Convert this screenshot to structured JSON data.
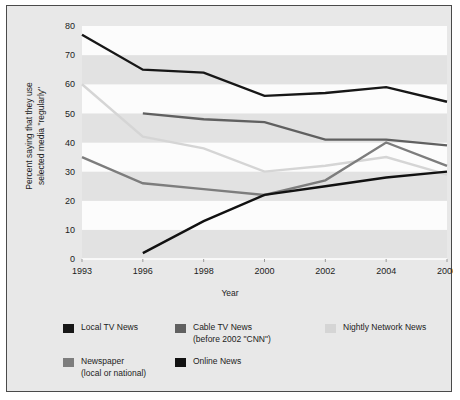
{
  "chart_data": {
    "type": "line",
    "title": "",
    "xlabel": "Year",
    "ylabel": "Percent saying that they use\nselected media \"regularly\"",
    "categories": [
      "1993",
      "1996",
      "1998",
      "2000",
      "2002",
      "2004",
      "2006"
    ],
    "x_tick_labels": [
      "1993",
      "1996",
      "1998",
      "2000",
      "2002",
      "2004",
      "2006"
    ],
    "y_tick_labels": [
      "0",
      "10",
      "20",
      "30",
      "40",
      "50",
      "60",
      "70",
      "80"
    ],
    "ylim": [
      0,
      80
    ],
    "y_tick_step": 10,
    "grid": "horizontal-banding",
    "legend_position": "bottom",
    "series": [
      {
        "name": "Local TV News",
        "color": "#171717",
        "values": [
          77,
          65,
          64,
          56,
          57,
          59,
          54
        ]
      },
      {
        "name": "Cable TV News\n(before 2002 \"CNN\")",
        "color": "#606060",
        "values": [
          null,
          50,
          48,
          47,
          41,
          41,
          39
        ]
      },
      {
        "name": "Nightly Network News",
        "color": "#d5d5d5",
        "values": [
          60,
          42,
          38,
          30,
          32,
          35,
          29
        ]
      },
      {
        "name": "Newspaper\n(local or national)",
        "color": "#7d7d7d",
        "values": [
          35,
          26,
          24,
          22,
          27,
          40,
          32
        ]
      },
      {
        "name": "Online News",
        "color": "#111111",
        "values": [
          null,
          2,
          13,
          22,
          25,
          28,
          30
        ]
      }
    ]
  },
  "legend": {
    "rows": [
      [
        {
          "label": "Local TV News",
          "color": "#171717"
        },
        {
          "label": "Cable TV News\n(before 2002 \"CNN\")",
          "color": "#606060"
        },
        {
          "label": "Nightly Network News",
          "color": "#d5d5d5"
        }
      ],
      [
        {
          "label": "Newspaper\n(local or national)",
          "color": "#7d7d7d"
        },
        {
          "label": "Online News",
          "color": "#111111"
        }
      ]
    ]
  },
  "style": {
    "panel_background": "#e8e8e8",
    "band_light": "#fcfcfc",
    "band_dark": "#e2e2e2",
    "border_color": "#4a4a4a",
    "text_color": "#1c1c1c"
  }
}
